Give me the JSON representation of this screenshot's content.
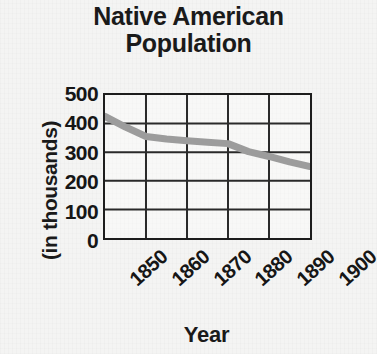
{
  "chart_data": {
    "type": "line",
    "title": "Native American\nPopulation",
    "title_line1": "Native American",
    "title_line2": "Population",
    "xlabel": "Year",
    "ylabel": "(in thousands)",
    "x": [
      1850,
      1860,
      1870,
      1880,
      1890,
      1900
    ],
    "xtick_labels": [
      "1850",
      "1860",
      "1870",
      "1880",
      "1890",
      "1900"
    ],
    "ytick_labels": [
      "0",
      "100",
      "200",
      "300",
      "400",
      "500"
    ],
    "ytick_values": [
      0,
      100,
      200,
      300,
      400,
      500
    ],
    "xlim": [
      1850,
      1900
    ],
    "ylim": [
      0,
      500
    ],
    "grid": true,
    "legend": "none",
    "series": [
      {
        "name": "Native American Population",
        "color": "#9c9c9c",
        "values": [
          425,
          355,
          340,
          330,
          285,
          250
        ]
      }
    ],
    "detail_points": [
      {
        "x": 1850,
        "y": 425
      },
      {
        "x": 1855,
        "y": 388
      },
      {
        "x": 1860,
        "y": 355
      },
      {
        "x": 1865,
        "y": 346
      },
      {
        "x": 1870,
        "y": 340
      },
      {
        "x": 1875,
        "y": 335
      },
      {
        "x": 1880,
        "y": 330
      },
      {
        "x": 1885,
        "y": 302
      },
      {
        "x": 1890,
        "y": 285
      },
      {
        "x": 1895,
        "y": 266
      },
      {
        "x": 1900,
        "y": 250
      }
    ]
  },
  "colors": {
    "line": "#9c9c9c",
    "axis": "#1d1d1d",
    "grid": "#2a2a2a",
    "text": "#161616",
    "background": "#f4f4f3"
  }
}
